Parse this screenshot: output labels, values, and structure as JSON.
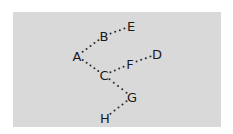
{
  "diagram": {
    "type": "tree",
    "edge_style": "dotted",
    "background": "#d9d9d9",
    "nodes": [
      {
        "id": "A",
        "label": "A"
      },
      {
        "id": "B",
        "label": "B"
      },
      {
        "id": "C",
        "label": "C"
      },
      {
        "id": "D",
        "label": "D"
      },
      {
        "id": "E",
        "label": "E"
      },
      {
        "id": "F",
        "label": "F"
      },
      {
        "id": "G",
        "label": "G"
      },
      {
        "id": "H",
        "label": "H"
      }
    ],
    "edges": [
      {
        "from": "A",
        "to": "B"
      },
      {
        "from": "B",
        "to": "E"
      },
      {
        "from": "A",
        "to": "C"
      },
      {
        "from": "C",
        "to": "F"
      },
      {
        "from": "F",
        "to": "D"
      },
      {
        "from": "C",
        "to": "G"
      },
      {
        "from": "G",
        "to": "H"
      }
    ]
  }
}
